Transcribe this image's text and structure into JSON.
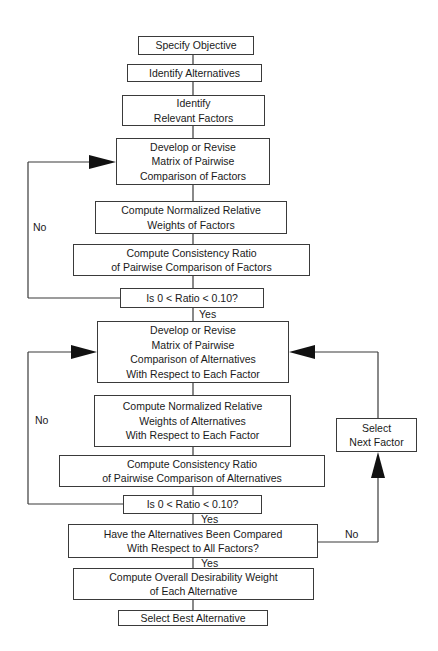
{
  "diagram": {
    "colors": {
      "line": "#3a3a3a",
      "text": "#1a1a1a",
      "background": "#ffffff"
    },
    "nodes": [
      {
        "id": "specify-objective",
        "lines": [
          "Specify Objective"
        ],
        "x": 138,
        "y": 36,
        "w": 116,
        "h": 19
      },
      {
        "id": "identify-alternatives",
        "lines": [
          "Identify Alternatives"
        ],
        "x": 127,
        "y": 64,
        "w": 135,
        "h": 18
      },
      {
        "id": "identify-relevant-factors",
        "lines": [
          "Identify",
          "Relevant Factors"
        ],
        "x": 122,
        "y": 95,
        "w": 143,
        "h": 31
      },
      {
        "id": "develop-factor-matrix",
        "lines": [
          "Develop or Revise",
          "Matrix of Pairwise",
          "Comparison of Factors"
        ],
        "x": 116,
        "y": 138,
        "w": 154,
        "h": 47
      },
      {
        "id": "compute-factor-weights",
        "lines": [
          "Compute Normalized Relative",
          "Weights of Factors"
        ],
        "x": 95,
        "y": 201,
        "w": 192,
        "h": 33
      },
      {
        "id": "compute-factor-consistency",
        "lines": [
          "Compute Consistency Ratio",
          "of Pairwise Comparison of Factors"
        ],
        "x": 73,
        "y": 244,
        "w": 237,
        "h": 32
      },
      {
        "id": "factor-ratio-check",
        "lines": [
          "Is 0 < Ratio < 0.10?"
        ],
        "x": 120,
        "y": 288,
        "w": 144,
        "h": 20
      },
      {
        "id": "develop-alternative-matrix",
        "lines": [
          "Develop or Revise",
          "Matrix of Pairwise",
          "Comparison of Alternatives",
          "With Respect to Each Factor"
        ],
        "x": 97,
        "y": 321,
        "w": 192,
        "h": 62
      },
      {
        "id": "compute-alternative-weights",
        "lines": [
          "Compute Normalized Relative",
          "Weights of Alternatives",
          "With Respect to Each Factor"
        ],
        "x": 94,
        "y": 395,
        "w": 197,
        "h": 52
      },
      {
        "id": "compute-alternative-consistency",
        "lines": [
          "Compute Consistency Ratio",
          "of Pairwise Comparison of Alternatives"
        ],
        "x": 59,
        "y": 455,
        "w": 266,
        "h": 32
      },
      {
        "id": "alternative-ratio-check",
        "lines": [
          "Is 0 < Ratio < 0.10?"
        ],
        "x": 123,
        "y": 495,
        "w": 139,
        "h": 19
      },
      {
        "id": "all-factors-compared-check",
        "lines": [
          "Have the Alternatives Been Compared",
          "With Respect to All Factors?"
        ],
        "x": 68,
        "y": 524,
        "w": 250,
        "h": 34
      },
      {
        "id": "compute-overall-weight",
        "lines": [
          "Compute Overall Desirability Weight",
          "of Each Alternative"
        ],
        "x": 73,
        "y": 568,
        "w": 241,
        "h": 32
      },
      {
        "id": "select-best-alternative",
        "lines": [
          "Select Best Alternative"
        ],
        "x": 118,
        "y": 610,
        "w": 150,
        "h": 16
      },
      {
        "id": "select-next-factor",
        "lines": [
          "Select",
          "Next Factor"
        ],
        "x": 336,
        "y": 418,
        "w": 81,
        "h": 34
      }
    ],
    "labels": [
      {
        "id": "no-factor-loop",
        "text": "No",
        "x": 33,
        "y": 222
      },
      {
        "id": "yes-factor-ratio",
        "text": "Yes",
        "x": 199,
        "y": 309
      },
      {
        "id": "no-alternative-loop",
        "text": "No",
        "x": 35,
        "y": 415
      },
      {
        "id": "yes-alternative-ratio",
        "text": "Yes",
        "x": 201,
        "y": 514
      },
      {
        "id": "no-next-factor",
        "text": "No",
        "x": 345,
        "y": 529
      },
      {
        "id": "yes-all-compared",
        "text": "Yes",
        "x": 201,
        "y": 558
      }
    ],
    "connectors": {
      "center_x": 193,
      "factor_loop": {
        "x": 28,
        "y_top": 162,
        "y_bottom": 298,
        "arrow_base_x": 89,
        "arrow_tip_x": 116
      },
      "alternative_loop": {
        "x": 28,
        "y_top": 352,
        "y_bottom": 504,
        "arrow_base_x": 71,
        "arrow_tip_x": 97
      },
      "next_factor_loop": {
        "x": 378,
        "y_top": 352,
        "y_bottom": 542,
        "arrow_tip_x": 289,
        "arrow_base_x": 315,
        "up_arrow_tip_y": 452,
        "up_arrow_base_y": 478
      }
    }
  }
}
